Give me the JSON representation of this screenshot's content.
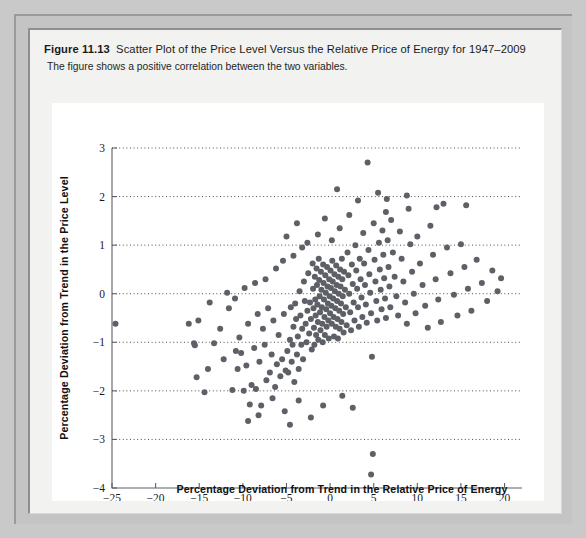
{
  "caption": {
    "figure_number": "Figure 11.13",
    "title": "Scatter Plot of the Price Level Versus the Relative Price of Energy for 1947–2009",
    "subtitle": "The figure shows a positive correlation between the two variables."
  },
  "colors": {
    "page_background": "#c9c9c9",
    "frame": "#c4c4c4",
    "panel": "#f2f2f0",
    "plot_background": "#ffffff",
    "point": "#5d6066",
    "axis": "#5b6168",
    "gridline": "#3a3a3a"
  },
  "chart_data": {
    "type": "scatter",
    "title": "Scatter Plot of the Price Level Versus the Relative Price of Energy for 1947–2009",
    "xlabel": "Percentage Deviation from Trend in the Relative Price of Energy",
    "ylabel": "Percentage Deviation from Trend in the Price Level",
    "xlim": [
      -25,
      22
    ],
    "ylim": [
      -4,
      3
    ],
    "xticks": [
      -25,
      -20,
      -15,
      -10,
      -5,
      0,
      5,
      10,
      15,
      20
    ],
    "xtick_labels": [
      "−25",
      "−20",
      "−15",
      "−10",
      "−5",
      "0",
      "5",
      "10",
      "15",
      "20"
    ],
    "yticks": [
      -4,
      -3,
      -2,
      -1,
      0,
      1,
      2,
      3
    ],
    "ytick_labels": [
      "−4",
      "−3",
      "−2",
      "−1",
      "0",
      "1",
      "2",
      "3"
    ],
    "grid": "horizontal-dotted-at-yticks",
    "legend": null,
    "marker": "filled-circle",
    "marker_size": 3.0,
    "n_points": 252,
    "correlation": "positive",
    "points": [
      [
        -24.6,
        -0.62
      ],
      [
        -16.2,
        -0.62
      ],
      [
        -15.6,
        -1.02
      ],
      [
        -15.5,
        -1.06
      ],
      [
        -15.3,
        -1.72
      ],
      [
        -15.1,
        -0.55
      ],
      [
        -14.4,
        -2.03
      ],
      [
        -14.0,
        -1.55
      ],
      [
        -13.3,
        -1.02
      ],
      [
        -12.6,
        -0.72
      ],
      [
        -12.2,
        -1.35
      ],
      [
        -11.6,
        -0.3
      ],
      [
        -11.2,
        -1.98
      ],
      [
        -10.9,
        -0.1
      ],
      [
        -10.6,
        -1.55
      ],
      [
        -10.4,
        -0.9
      ],
      [
        -10.2,
        -1.22
      ],
      [
        -9.9,
        -2.0
      ],
      [
        -9.6,
        -1.48
      ],
      [
        -9.4,
        -0.62
      ],
      [
        -9.2,
        -2.28
      ],
      [
        -9.0,
        -1.88
      ],
      [
        -8.7,
        -1.12
      ],
      [
        -8.5,
        -1.96
      ],
      [
        -8.3,
        -0.42
      ],
      [
        -8.1,
        -1.4
      ],
      [
        -7.9,
        -2.3
      ],
      [
        -7.7,
        -0.72
      ],
      [
        -7.5,
        -1.05
      ],
      [
        -7.3,
        -1.78
      ],
      [
        -7.1,
        -0.3
      ],
      [
        -6.9,
        -1.62
      ],
      [
        -6.7,
        -1.25
      ],
      [
        -6.5,
        -0.55
      ],
      [
        -6.3,
        -1.92
      ],
      [
        -6.1,
        -1.45
      ],
      [
        -5.9,
        -0.85
      ],
      [
        -5.7,
        -1.7
      ],
      [
        -5.5,
        -1.35
      ],
      [
        -5.3,
        -0.42
      ],
      [
        -5.1,
        -1.58
      ],
      [
        -4.9,
        -1.18
      ],
      [
        -4.8,
        -1.62
      ],
      [
        -4.6,
        -0.95
      ],
      [
        -4.5,
        -0.28
      ],
      [
        -4.4,
        -1.4
      ],
      [
        -4.3,
        -1.05
      ],
      [
        -4.2,
        -0.68
      ],
      [
        -4.1,
        -1.82
      ],
      [
        -4.0,
        -0.2
      ],
      [
        -3.9,
        -0.52
      ],
      [
        -3.8,
        -1.25
      ],
      [
        -3.7,
        -0.88
      ],
      [
        -3.6,
        -1.55
      ],
      [
        -3.5,
        0.05
      ],
      [
        -3.4,
        -0.45
      ],
      [
        -3.3,
        -1.05
      ],
      [
        -3.2,
        -0.72
      ],
      [
        -3.1,
        -1.35
      ],
      [
        -3.0,
        0.25
      ],
      [
        -2.9,
        -0.15
      ],
      [
        -2.8,
        -0.62
      ],
      [
        -2.7,
        -1.0
      ],
      [
        -2.6,
        -0.35
      ],
      [
        -2.5,
        0.42
      ],
      [
        -2.4,
        -0.82
      ],
      [
        -2.3,
        -0.18
      ],
      [
        -2.2,
        -0.52
      ],
      [
        -2.1,
        -1.15
      ],
      [
        -2.0,
        0.62
      ],
      [
        -1.95,
        0.1
      ],
      [
        -1.9,
        -0.3
      ],
      [
        -1.85,
        -0.7
      ],
      [
        -1.8,
        -1.05
      ],
      [
        -1.75,
        0.35
      ],
      [
        -1.7,
        -0.12
      ],
      [
        -1.65,
        -0.45
      ],
      [
        -1.6,
        -0.85
      ],
      [
        -1.55,
        0.52
      ],
      [
        -1.5,
        0.18
      ],
      [
        -1.45,
        -0.22
      ],
      [
        -1.4,
        -0.58
      ],
      [
        -1.35,
        -0.95
      ],
      [
        -1.3,
        0.72
      ],
      [
        -1.25,
        0.28
      ],
      [
        -1.2,
        -0.05
      ],
      [
        -1.15,
        -0.38
      ],
      [
        -1.1,
        -0.75
      ],
      [
        -1.05,
        0.45
      ],
      [
        -1.0,
        0.08
      ],
      [
        -0.95,
        -0.28
      ],
      [
        -0.9,
        -0.62
      ],
      [
        -0.85,
        -1.0
      ],
      [
        -0.8,
        0.6
      ],
      [
        -0.75,
        0.22
      ],
      [
        -0.7,
        -0.12
      ],
      [
        -0.65,
        -0.48
      ],
      [
        -0.6,
        -0.85
      ],
      [
        -0.55,
        0.38
      ],
      [
        -0.5,
        0.02
      ],
      [
        -0.45,
        -0.32
      ],
      [
        -0.4,
        -0.68
      ],
      [
        -0.35,
        0.55
      ],
      [
        -0.3,
        0.15
      ],
      [
        -0.25,
        -0.2
      ],
      [
        -0.2,
        -0.55
      ],
      [
        -0.15,
        -0.92
      ],
      [
        -0.1,
        0.3
      ],
      [
        -0.05,
        -0.05
      ],
      [
        0.0,
        -0.4
      ],
      [
        0.05,
        0.48
      ],
      [
        0.1,
        0.12
      ],
      [
        0.15,
        -0.25
      ],
      [
        0.2,
        -0.62
      ],
      [
        0.25,
        0.68
      ],
      [
        0.3,
        0.25
      ],
      [
        0.35,
        -0.1
      ],
      [
        0.4,
        -0.48
      ],
      [
        0.45,
        -0.88
      ],
      [
        0.5,
        0.4
      ],
      [
        0.55,
        0.05
      ],
      [
        0.6,
        -0.3
      ],
      [
        0.65,
        -0.68
      ],
      [
        0.7,
        0.58
      ],
      [
        0.75,
        0.18
      ],
      [
        0.8,
        -0.15
      ],
      [
        0.85,
        -0.52
      ],
      [
        0.9,
        -0.92
      ],
      [
        0.95,
        0.35
      ],
      [
        1.0,
        0.0
      ],
      [
        1.05,
        -0.35
      ],
      [
        1.1,
        -0.72
      ],
      [
        1.15,
        0.5
      ],
      [
        1.2,
        0.15
      ],
      [
        1.25,
        -0.2
      ],
      [
        1.3,
        -0.58
      ],
      [
        1.35,
        0.72
      ],
      [
        1.4,
        0.3
      ],
      [
        1.45,
        -0.05
      ],
      [
        1.5,
        -0.42
      ],
      [
        1.55,
        -0.8
      ],
      [
        1.6,
        0.45
      ],
      [
        1.7,
        0.08
      ],
      [
        1.8,
        -0.28
      ],
      [
        1.9,
        -0.65
      ],
      [
        2.0,
        0.85
      ],
      [
        2.1,
        0.38
      ],
      [
        2.2,
        0.0
      ],
      [
        2.3,
        -0.38
      ],
      [
        2.4,
        -0.75
      ],
      [
        2.5,
        0.6
      ],
      [
        2.6,
        0.2
      ],
      [
        2.7,
        -0.18
      ],
      [
        2.8,
        -0.55
      ],
      [
        2.9,
        1.0
      ],
      [
        3.0,
        0.48
      ],
      [
        3.1,
        0.1
      ],
      [
        3.2,
        -0.28
      ],
      [
        3.3,
        -0.68
      ],
      [
        3.4,
        0.72
      ],
      [
        3.5,
        0.3
      ],
      [
        3.6,
        -0.08
      ],
      [
        3.7,
        -0.48
      ],
      [
        3.8,
        1.25
      ],
      [
        3.9,
        0.62
      ],
      [
        4.0,
        0.18
      ],
      [
        4.1,
        -0.22
      ],
      [
        4.2,
        -0.6
      ],
      [
        4.3,
        2.7
      ],
      [
        4.4,
        0.9
      ],
      [
        4.5,
        0.4
      ],
      [
        4.6,
        0.02
      ],
      [
        4.7,
        -0.4
      ],
      [
        4.8,
        -1.3
      ],
      [
        4.9,
        -3.3
      ],
      [
        4.7,
        -3.72
      ],
      [
        5.0,
        1.45
      ],
      [
        5.1,
        0.7
      ],
      [
        5.2,
        0.25
      ],
      [
        5.3,
        -0.15
      ],
      [
        5.4,
        -0.55
      ],
      [
        5.5,
        2.08
      ],
      [
        5.6,
        1.05
      ],
      [
        5.7,
        0.5
      ],
      [
        5.8,
        0.08
      ],
      [
        5.9,
        -0.32
      ],
      [
        6.0,
        1.3
      ],
      [
        6.1,
        0.8
      ],
      [
        6.2,
        0.32
      ],
      [
        6.3,
        -0.1
      ],
      [
        6.4,
        -0.5
      ],
      [
        6.5,
        1.95
      ],
      [
        6.6,
        1.1
      ],
      [
        6.7,
        0.55
      ],
      [
        6.8,
        0.15
      ],
      [
        6.9,
        -0.28
      ],
      [
        7.0,
        1.52
      ],
      [
        7.2,
        0.85
      ],
      [
        7.4,
        0.35
      ],
      [
        7.6,
        -0.05
      ],
      [
        7.8,
        -0.45
      ],
      [
        8.0,
        1.28
      ],
      [
        8.2,
        0.72
      ],
      [
        8.4,
        0.25
      ],
      [
        8.6,
        -0.18
      ],
      [
        8.8,
        -0.62
      ],
      [
        9.0,
        1.75
      ],
      [
        9.2,
        1.02
      ],
      [
        9.4,
        0.45
      ],
      [
        9.6,
        0.0
      ],
      [
        9.8,
        -0.4
      ],
      [
        10.0,
        1.18
      ],
      [
        10.3,
        0.62
      ],
      [
        10.6,
        0.18
      ],
      [
        10.9,
        -0.25
      ],
      [
        11.2,
        -0.7
      ],
      [
        11.5,
        1.4
      ],
      [
        11.8,
        0.8
      ],
      [
        12.1,
        0.3
      ],
      [
        12.4,
        -0.12
      ],
      [
        12.7,
        -0.58
      ],
      [
        13.0,
        1.85
      ],
      [
        13.4,
        0.95
      ],
      [
        13.8,
        0.42
      ],
      [
        14.2,
        -0.02
      ],
      [
        14.6,
        -0.45
      ],
      [
        15.0,
        1.02
      ],
      [
        15.4,
        0.55
      ],
      [
        15.8,
        0.1
      ],
      [
        16.2,
        -0.35
      ],
      [
        16.8,
        0.7
      ],
      [
        17.4,
        0.22
      ],
      [
        18.0,
        -0.15
      ],
      [
        18.6,
        0.48
      ],
      [
        19.2,
        0.05
      ],
      [
        19.6,
        0.32
      ],
      [
        -2.6,
        1.05
      ],
      [
        -1.4,
        1.22
      ],
      [
        -0.6,
        1.55
      ],
      [
        0.2,
        1.1
      ],
      [
        1.1,
        1.35
      ],
      [
        2.2,
        1.62
      ],
      [
        -3.2,
        0.95
      ],
      [
        -4.2,
        0.78
      ],
      [
        3.2,
        1.92
      ],
      [
        -5.4,
        0.68
      ],
      [
        -6.2,
        0.52
      ],
      [
        -7.4,
        0.3
      ],
      [
        -8.6,
        0.22
      ],
      [
        -9.8,
        0.12
      ],
      [
        -11.8,
        0.02
      ],
      [
        -5.0,
        1.18
      ],
      [
        -3.8,
        1.45
      ],
      [
        0.8,
        2.15
      ],
      [
        6.4,
        1.68
      ],
      [
        8.8,
        2.02
      ],
      [
        12.2,
        1.78
      ],
      [
        15.6,
        1.82
      ],
      [
        -2.2,
        -2.55
      ],
      [
        -0.8,
        -2.3
      ],
      [
        -3.6,
        -2.2
      ],
      [
        -5.2,
        -2.42
      ],
      [
        -6.6,
        -2.15
      ],
      [
        -8.2,
        -2.5
      ],
      [
        1.4,
        -2.1
      ],
      [
        2.6,
        -2.35
      ],
      [
        -9.4,
        -2.62
      ],
      [
        -4.6,
        -2.7
      ],
      [
        -10.8,
        -1.18
      ],
      [
        -13.8,
        -0.18
      ]
    ]
  }
}
